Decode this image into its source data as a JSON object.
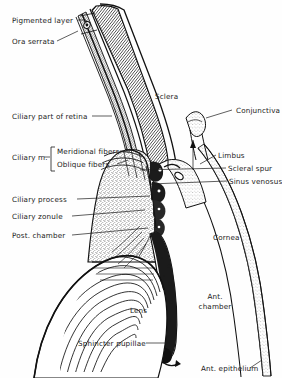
{
  "figure": {
    "type": "anatomical-line-diagram",
    "background_color": "#fefefe",
    "ink_color": "#1a1a1a",
    "width": 282,
    "height": 378
  },
  "labels_left": [
    {
      "id": "pigmented-layer",
      "text": "Pigmented layer",
      "x": 12,
      "y": 23,
      "leader_to_x": 84,
      "leader_to_y": 23
    },
    {
      "id": "ora-serrata",
      "text": "Ora serrata",
      "x": 12,
      "y": 44,
      "leader_to_x": 82,
      "leader_to_y": 33
    },
    {
      "id": "ciliary-part-retina",
      "text": "Ciliary part of retina",
      "x": 12,
      "y": 119,
      "leader_to_x": 112,
      "leader_to_y": 119
    },
    {
      "id": "ciliary-muscle",
      "text": "Ciliary m.",
      "x": 12,
      "y": 160,
      "leader_to_x": 50,
      "leader_to_y": 160
    },
    {
      "id": "meridional-fibers",
      "text": "Meridional fibers",
      "x": 57,
      "y": 154,
      "leader_to_x": 126,
      "leader_to_y": 150
    },
    {
      "id": "oblique-fibers",
      "text": "Oblique fibers",
      "x": 57,
      "y": 167,
      "leader_to_x": 126,
      "leader_to_y": 163
    },
    {
      "id": "ciliary-process",
      "text": "Ciliary process",
      "x": 12,
      "y": 202,
      "leader_to_x": 133,
      "leader_to_y": 198
    },
    {
      "id": "ciliary-zonule",
      "text": "Ciliary zonule",
      "x": 12,
      "y": 219,
      "leader_to_x": 131,
      "leader_to_y": 214
    },
    {
      "id": "post-chamber",
      "text": "Post. chamber",
      "x": 12,
      "y": 238,
      "leader_to_x": 137,
      "leader_to_y": 232
    },
    {
      "id": "sphincter-pupillae",
      "text": "Sphincter pupillae",
      "x": 78,
      "y": 346,
      "leader_to_x": 172,
      "leader_to_y": 343
    }
  ],
  "labels_right": [
    {
      "id": "conjunctiva",
      "text": "Conjunctiva",
      "x": 236,
      "y": 113,
      "leader_to_x": 204,
      "leader_to_y": 117
    },
    {
      "id": "limbus",
      "text": "Limbus",
      "x": 218,
      "y": 158,
      "leader_to_x": 198,
      "leader_to_y": 161
    },
    {
      "id": "scleral-spur",
      "text": "Scleral spur",
      "x": 228,
      "y": 171,
      "leader_to_x": 140,
      "leader_to_y": 171
    },
    {
      "id": "sinus-venosus",
      "text": "Sinus venosus",
      "x": 229,
      "y": 184,
      "leader_to_x": 148,
      "leader_to_y": 184
    },
    {
      "id": "ant-epithelium",
      "text": "Ant. epithelium",
      "x": 201,
      "y": 371,
      "leader_to_x": 265,
      "leader_to_y": 363
    }
  ],
  "labels_inline": [
    {
      "id": "sclera",
      "text": "Sclera",
      "x": 155,
      "y": 99
    },
    {
      "id": "cornea",
      "text": "Cornea",
      "x": 213,
      "y": 240
    },
    {
      "id": "lens",
      "text": "Lens",
      "x": 130,
      "y": 313
    },
    {
      "id": "ant-chamber-1",
      "text": "Ant.",
      "x": 206,
      "y": 299
    },
    {
      "id": "ant-chamber-2",
      "text": "chamber",
      "x": 206,
      "y": 309
    }
  ],
  "structures": [
    "sclera",
    "cornea",
    "conjunctiva",
    "limbus",
    "scleral spur",
    "sinus venosus",
    "ciliary muscle",
    "ciliary process",
    "ciliary zonule",
    "posterior chamber",
    "anterior chamber",
    "lens",
    "iris",
    "sphincter pupillae",
    "pigmented layer",
    "ora serrata",
    "ciliary part of retina",
    "anterior epithelium"
  ]
}
